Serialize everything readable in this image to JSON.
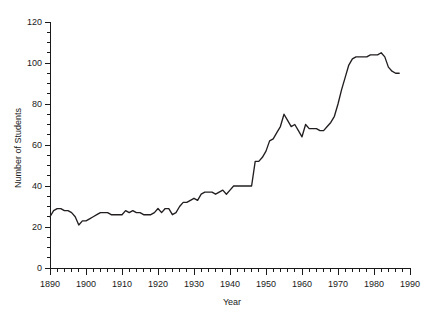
{
  "chart_data": {
    "type": "line",
    "title": "",
    "xlabel": "Year",
    "ylabel": "Number of Students",
    "xlim": [
      1890,
      1990
    ],
    "ylim": [
      0,
      120
    ],
    "grid": false,
    "legend": false,
    "x_major_ticks": [
      1890,
      1900,
      1910,
      1920,
      1930,
      1940,
      1950,
      1960,
      1970,
      1980,
      1990
    ],
    "x_tick_labels": [
      "1890",
      "1900",
      "1910",
      "1920",
      "1930",
      "1940",
      "1950",
      "1960",
      "1970",
      "1980",
      "1990"
    ],
    "x_minor_tick_step": 2,
    "y_major_ticks": [
      0,
      20,
      40,
      60,
      80,
      100,
      120
    ],
    "y_tick_labels": [
      "0",
      "20",
      "40",
      "60",
      "80",
      "100",
      "120"
    ],
    "y_minor_tick_step": 5,
    "series": [
      {
        "name": "Number of Students",
        "color": "#231f20",
        "x": [
          1890,
          1891,
          1892,
          1893,
          1894,
          1895,
          1896,
          1897,
          1898,
          1899,
          1900,
          1901,
          1902,
          1903,
          1904,
          1905,
          1906,
          1907,
          1908,
          1909,
          1910,
          1911,
          1912,
          1913,
          1914,
          1915,
          1916,
          1917,
          1918,
          1919,
          1920,
          1921,
          1922,
          1923,
          1924,
          1925,
          1926,
          1927,
          1928,
          1929,
          1930,
          1931,
          1932,
          1933,
          1934,
          1935,
          1936,
          1937,
          1938,
          1939,
          1940,
          1941,
          1942,
          1943,
          1944,
          1945,
          1946,
          1947,
          1948,
          1949,
          1950,
          1951,
          1952,
          1953,
          1954,
          1955,
          1956,
          1957,
          1958,
          1959,
          1960,
          1961,
          1962,
          1963,
          1964,
          1965,
          1966,
          1967,
          1968,
          1969,
          1970,
          1971,
          1972,
          1973,
          1974,
          1975,
          1976,
          1977,
          1978,
          1979,
          1980,
          1981,
          1982,
          1983,
          1984,
          1985,
          1986,
          1987
        ],
        "values": [
          25,
          28,
          29,
          29,
          28,
          28,
          27,
          25,
          21,
          23,
          23,
          24,
          25,
          26,
          27,
          27,
          27,
          26,
          26,
          26,
          26,
          28,
          27,
          28,
          27,
          27,
          26,
          26,
          26,
          27,
          29,
          27,
          29,
          29,
          26,
          27,
          30,
          32,
          32,
          33,
          34,
          33,
          36,
          37,
          37,
          37,
          36,
          37,
          38,
          36,
          38,
          40,
          40,
          40,
          40,
          40,
          40,
          52,
          52,
          54,
          57,
          62,
          63,
          66,
          69,
          75,
          72,
          69,
          70,
          67,
          64,
          70,
          68,
          68,
          68,
          67,
          67,
          69,
          71,
          74,
          80,
          87,
          93,
          99,
          102,
          103,
          103,
          103,
          103,
          104,
          104,
          104,
          105,
          103,
          98,
          96,
          95,
          95
        ]
      }
    ]
  },
  "axes": {
    "x_axis_name": "year-axis",
    "y_axis_name": "students-axis"
  },
  "colors": {
    "line": "#231f20",
    "axis": "#1a1a1a",
    "background": "#ffffff"
  }
}
